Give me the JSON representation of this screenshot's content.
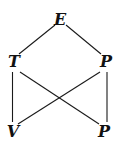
{
  "diagram": {
    "type": "lattice",
    "nodes": [
      {
        "id": "E",
        "label": "E",
        "x": 60,
        "y": 20
      },
      {
        "id": "T",
        "label": "T",
        "x": 14,
        "y": 62
      },
      {
        "id": "P1",
        "label": "P",
        "x": 106,
        "y": 62
      },
      {
        "id": "V",
        "label": "V",
        "x": 13,
        "y": 132
      },
      {
        "id": "P2",
        "label": "P",
        "x": 104,
        "y": 132
      }
    ],
    "edges": [
      {
        "from": "E",
        "to": "T"
      },
      {
        "from": "E",
        "to": "P1"
      },
      {
        "from": "T",
        "to": "V"
      },
      {
        "from": "T",
        "to": "P2"
      },
      {
        "from": "P1",
        "to": "V"
      },
      {
        "from": "P1",
        "to": "P2"
      }
    ]
  }
}
